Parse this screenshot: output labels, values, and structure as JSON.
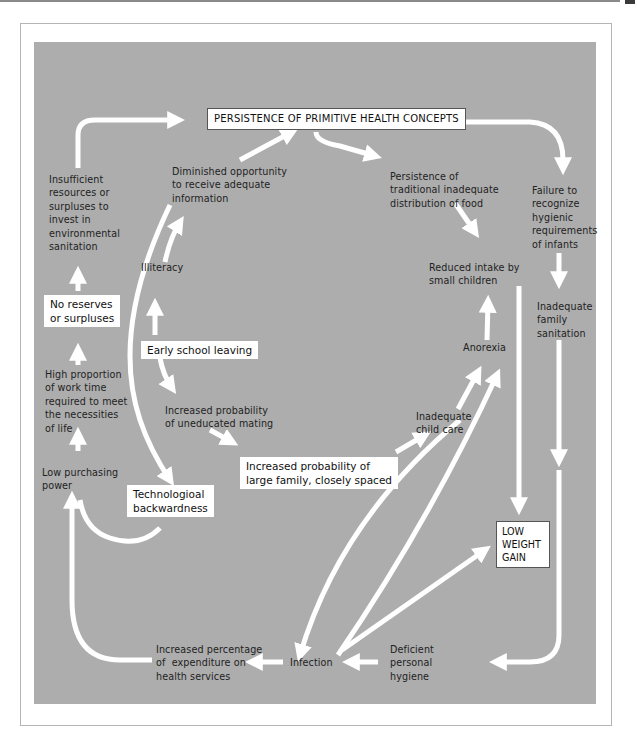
{
  "diagram": {
    "title_box": "PERSISTENCE OF PRIMITIVE HEALTH CONCEPTS",
    "nodes": {
      "insufficient_resources": "Insufficient\nresources or\nsurpluses to\ninvest in\nenvironmental\nsanitation",
      "no_reserves": "No reserves\nor surpluses",
      "high_proportion": "High proportion\nof work time\nrequired to meet\nthe necessities\nof life",
      "low_purchasing": "Low purchasing\npower",
      "technological": "Technologioal\nbackwardness",
      "diminished_opportunity": "Diminished opportunity\nto receive adequate\ninformation",
      "illiteracy": "Illiteracy",
      "early_school": "Early school leaving",
      "uneducated_mating": "Increased probability\nof uneducated mating",
      "large_family": "Increased probability of\nlarge family, closely spaced",
      "traditional_distribution": "Persistence of\ntraditional inadequate\ndistribution of food",
      "failure_recognize": "Failure to\nrecognize\nhygienic\nrequirements\nof infants",
      "reduced_intake": "Reduced intake by\nsmall children",
      "inadequate_sanitation": "Inadequate\nfamily\nsanitation",
      "anorexia": "Anorexia",
      "child_care": "Inadequate\nchild care",
      "low_weight_gain": "LOW\nWEIGHT\nGAIN",
      "infection": "Infection",
      "expenditure": "Increased percentage\nof  expenditure on\nhealth services",
      "deficient_hygiene": "Deficient\npersonal\nhygiene"
    },
    "colors": {
      "background": "#adadad",
      "arrow": "#ffffff",
      "box_fill": "#ffffff",
      "text": "#222222"
    }
  }
}
